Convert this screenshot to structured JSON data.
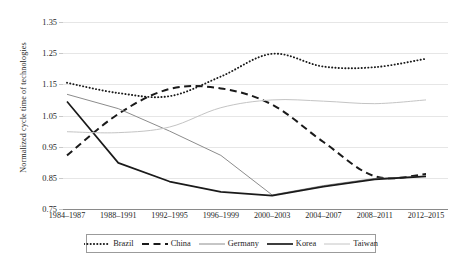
{
  "chart_data": {
    "type": "line",
    "title": "",
    "xlabel": "",
    "ylabel": "Normalized cycle time of technologies",
    "categories": [
      "1984–1987",
      "1988–1991",
      "1992–1995",
      "1996–1999",
      "2000–2003",
      "2004–2007",
      "2008–2011",
      "2012–2015"
    ],
    "ylim": [
      0.75,
      1.35
    ],
    "yticks": [
      0.75,
      0.85,
      0.95,
      1.05,
      1.15,
      1.25,
      1.35
    ],
    "ytick_labels": [
      "0.75",
      "0.85",
      "0.95",
      "1.05",
      "1.15",
      "1.25",
      "1.35"
    ],
    "grid": true,
    "legend_position": "bottom",
    "series": [
      {
        "name": "Brazil",
        "style": "dotted",
        "color": "#1a1a1a",
        "values": [
          1.155,
          1.122,
          1.112,
          1.175,
          1.248,
          1.207,
          1.205,
          1.232
        ]
      },
      {
        "name": "China",
        "style": "dashed",
        "color": "#1a1a1a",
        "values": [
          0.922,
          1.055,
          1.135,
          1.137,
          1.085,
          0.965,
          0.855,
          0.862
        ]
      },
      {
        "name": "Germany",
        "style": "solid",
        "color": "#8c8c8c",
        "values": [
          1.118,
          1.072,
          1.0,
          0.922,
          0.795,
          0.825,
          0.848,
          0.855
        ]
      },
      {
        "name": "Korea",
        "style": "solid-bold",
        "color": "#1a1a1a",
        "values": [
          1.095,
          0.898,
          0.838,
          0.805,
          0.793,
          0.822,
          0.845,
          0.855
        ]
      },
      {
        "name": "Taiwan",
        "style": "solid-light",
        "color": "#c4c4c4",
        "values": [
          0.998,
          0.995,
          1.013,
          1.075,
          1.1,
          1.096,
          1.088,
          1.1
        ]
      }
    ]
  },
  "legend": {
    "items": [
      {
        "label": "Brazil"
      },
      {
        "label": "China"
      },
      {
        "label": "Germany"
      },
      {
        "label": "Korea"
      },
      {
        "label": "Taiwan"
      }
    ]
  },
  "caption": {
    "text": ""
  }
}
